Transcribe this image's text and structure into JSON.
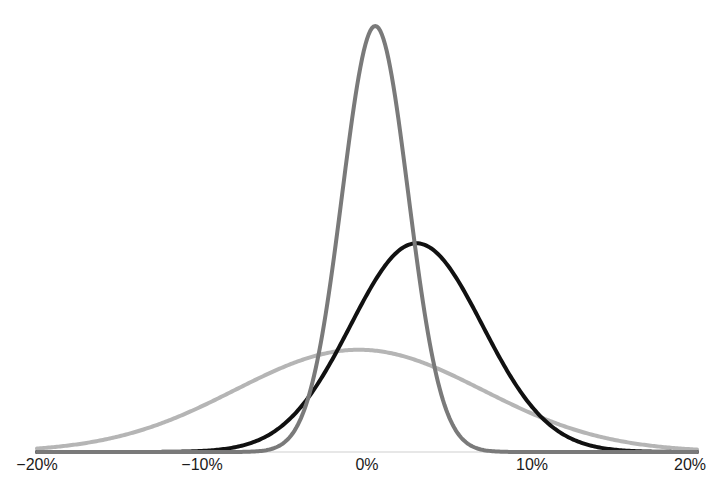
{
  "chart_data": {
    "type": "line",
    "title": "",
    "xlabel": "",
    "ylabel": "",
    "xlim": [
      -20,
      20
    ],
    "x_unit": "%",
    "grid": false,
    "legend": null,
    "x_ticks": [
      "−20%",
      "−10%",
      "0%",
      "10%",
      "20%"
    ],
    "x_tick_values": [
      -20,
      -10,
      0,
      10,
      20
    ],
    "series": [
      {
        "name": "narrow distribution",
        "color": "#7a7a7a",
        "mean": 0.5,
        "sd": 2.0,
        "relative_peak": 1.0
      },
      {
        "name": "shifted distribution",
        "color": "#111111",
        "mean": 3.0,
        "sd": 4.0,
        "relative_peak": 0.49
      },
      {
        "name": "wide distribution",
        "color": "#b5b5b5",
        "mean": -0.5,
        "sd": 7.5,
        "relative_peak": 0.24
      }
    ]
  }
}
